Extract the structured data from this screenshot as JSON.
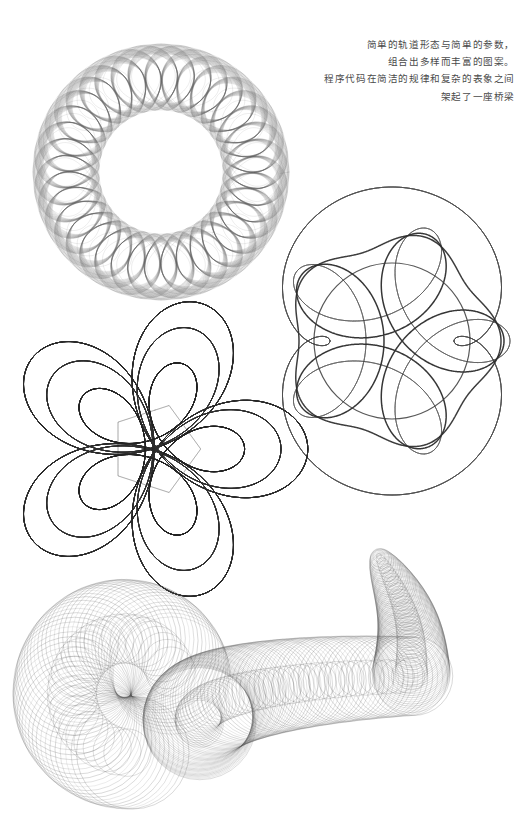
{
  "poster": {
    "background_color": "#ffffff",
    "width": 529,
    "height": 836,
    "ink_color": "#3a3a3a"
  },
  "caption": {
    "alignment": "right",
    "text_color": "#4a4a4a",
    "lines": [
      "简单的轨道形态与简单的参数，",
      "组合出多样而丰富的图案。",
      "程序代码在简洁的规律和复杂的表象之间",
      "架起了一座桥梁"
    ],
    "line_1": "简单的轨道形态与简单的参数，",
    "line_2": "组合出多样而丰富的图案。",
    "line_3": "程序代码在简洁的规律和复杂的表象之间",
    "line_4": "架起了一座桥梁"
  },
  "chart_data": {
    "type": "line",
    "title": "",
    "xlabel": "",
    "ylabel": "",
    "figures": [
      {
        "id": "figure-1",
        "name": "petal-ring-hypotrochoid",
        "curve": "hypotrochoid",
        "center": [
          161,
          172
        ],
        "outer_radius": 128,
        "inner_hole_radius": 62,
        "lobes": 36,
        "turns": 36,
        "samples": 4200,
        "R": 128,
        "r": 31,
        "d": 78,
        "repeat_offset": 9,
        "repeat_count": 14,
        "stroke_width": 0.35,
        "stroke_color": "#5a5a5a",
        "opacity": 0.55
      },
      {
        "id": "figure-2",
        "name": "five-lobe-rosette",
        "curve": "epitrochoid-with-bold-envelope",
        "center": [
          392,
          341
        ],
        "outer_radius": 109,
        "inner_hole_radius": 44,
        "lobes": 5,
        "turns": 5,
        "samples": 3000,
        "R": 72,
        "r": 36,
        "d": 46,
        "repeat_offset": 3,
        "repeat_count": 26,
        "bold_stroke_width": 1.5,
        "stroke_width": 0.3,
        "stroke_color": "#4a4a4a",
        "opacity": 0.5
      },
      {
        "id": "figure-3",
        "name": "dense-pentagon-weave",
        "curve": "hypotrochoid-dense",
        "center": [
          155,
          449
        ],
        "outer_radius": 96,
        "inner_hole_radius": 37,
        "lobes": 5,
        "turns": 110,
        "samples": 9000,
        "R": 96,
        "r": 38.5,
        "d": 60,
        "repeat_offset": 1.5,
        "repeat_count": 60,
        "stroke_width": 0.22,
        "stroke_color": "#2e2e2e",
        "opacity": 0.75
      },
      {
        "id": "figure-4",
        "name": "spiral-tentacle-circles",
        "curve": "logarithmic-spiral-of-circles",
        "head": [
          425,
          535
        ],
        "tail": [
          70,
          700
        ],
        "circle_count": 190,
        "min_circle_radius": 6,
        "max_circle_radius": 66,
        "spiral_turns": 1.55,
        "stroke_width": 0.35,
        "stroke_color": "#555555",
        "opacity": 0.55
      }
    ]
  }
}
